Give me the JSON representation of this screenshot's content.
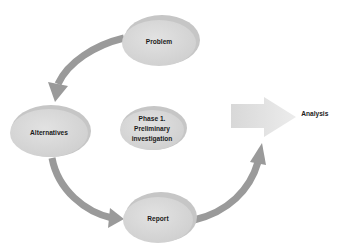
{
  "diagram": {
    "center_label": "Phase 1.\nPreliminary\ninvestigation",
    "center_lines": [
      "Phase 1.",
      "Preliminary",
      "investigation"
    ],
    "nodes": [
      {
        "id": "problem",
        "label": "Problem"
      },
      {
        "id": "alternatives",
        "label": "Alternatives"
      },
      {
        "id": "report",
        "label": "Report"
      }
    ],
    "output": {
      "label": "Analysis"
    },
    "flow": [
      "Problem",
      "Alternatives",
      "Report",
      "Analysis"
    ],
    "colors": {
      "node_fill": "#d9d9d9",
      "node_shade": "#c4c4c4",
      "arrow": "#9a9a9a",
      "big_arrow": "#e2e2e2",
      "text": "#1a1a1a"
    }
  }
}
